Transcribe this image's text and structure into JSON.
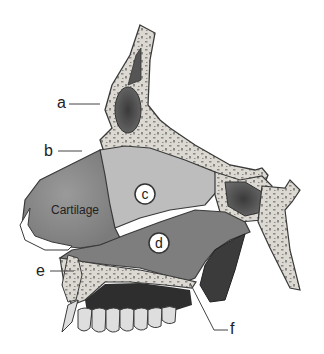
{
  "diagram": {
    "labels": {
      "a": "a",
      "b": "b",
      "c": "c",
      "d": "d",
      "e": "e",
      "f": "f",
      "cartilage": "Cartilage"
    },
    "colors": {
      "bone": "#d9d6cf",
      "bone_spots": "#8c8a86",
      "outline": "#3a3a3a",
      "cartilage": "#8f8f8f",
      "region_c": "#b9b9b9",
      "region_d": "#7d7d7d",
      "sinus_dark": "#4a4a4a",
      "teeth": "#dcdcdc",
      "gum_dark": "#2e2e2e"
    }
  }
}
